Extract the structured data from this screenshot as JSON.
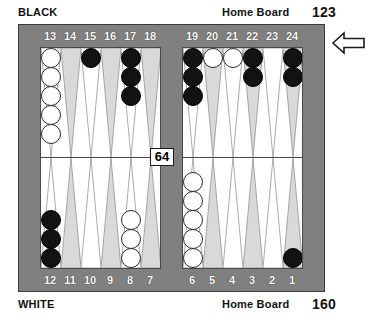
{
  "header": {
    "top_player": "BLACK",
    "top_home_label": "Home Board",
    "top_pip_count": "123"
  },
  "footer": {
    "bottom_player": "WHITE",
    "bottom_home_label": "Home Board",
    "bottom_pip_count": "160"
  },
  "bar": {
    "dice": "64"
  },
  "turn_indicator": {
    "icon": "arrow-left-icon",
    "direction": "left"
  },
  "colors": {
    "frame": "#808080",
    "field": "#ffffff",
    "point_light": "#d9d9d9",
    "point_outline": "#8a8a8a",
    "checker_white": "#ffffff",
    "checker_black": "#121212",
    "number_text": "#ffffff",
    "caption_text": "#111111"
  },
  "board": {
    "top_left_numbers": [
      "13",
      "14",
      "15",
      "16",
      "17",
      "18"
    ],
    "top_right_numbers": [
      "19",
      "20",
      "21",
      "22",
      "23",
      "24"
    ],
    "bottom_left_numbers": [
      "12",
      "11",
      "10",
      "9",
      "8",
      "7"
    ],
    "bottom_right_numbers": [
      "6",
      "5",
      "4",
      "3",
      "2",
      "1"
    ],
    "points": [
      {
        "number": "13",
        "quad": "top-left",
        "slot": 0,
        "checkers": 5,
        "color": "white"
      },
      {
        "number": "14",
        "quad": "top-left",
        "slot": 1,
        "checkers": 0,
        "color": "none"
      },
      {
        "number": "15",
        "quad": "top-left",
        "slot": 2,
        "checkers": 1,
        "color": "black"
      },
      {
        "number": "16",
        "quad": "top-left",
        "slot": 3,
        "checkers": 0,
        "color": "none"
      },
      {
        "number": "17",
        "quad": "top-left",
        "slot": 4,
        "checkers": 3,
        "color": "black"
      },
      {
        "number": "18",
        "quad": "top-left",
        "slot": 5,
        "checkers": 0,
        "color": "none"
      },
      {
        "number": "19",
        "quad": "top-right",
        "slot": 0,
        "checkers": 3,
        "color": "black"
      },
      {
        "number": "20",
        "quad": "top-right",
        "slot": 1,
        "checkers": 1,
        "color": "white"
      },
      {
        "number": "21",
        "quad": "top-right",
        "slot": 2,
        "checkers": 1,
        "color": "white"
      },
      {
        "number": "22",
        "quad": "top-right",
        "slot": 3,
        "checkers": 2,
        "color": "black"
      },
      {
        "number": "23",
        "quad": "top-right",
        "slot": 4,
        "checkers": 0,
        "color": "none"
      },
      {
        "number": "24",
        "quad": "top-right",
        "slot": 5,
        "checkers": 2,
        "color": "black"
      },
      {
        "number": "12",
        "quad": "bottom-left",
        "slot": 0,
        "checkers": 3,
        "color": "black"
      },
      {
        "number": "11",
        "quad": "bottom-left",
        "slot": 1,
        "checkers": 0,
        "color": "none"
      },
      {
        "number": "10",
        "quad": "bottom-left",
        "slot": 2,
        "checkers": 0,
        "color": "none"
      },
      {
        "number": "9",
        "quad": "bottom-left",
        "slot": 3,
        "checkers": 0,
        "color": "none"
      },
      {
        "number": "8",
        "quad": "bottom-left",
        "slot": 4,
        "checkers": 3,
        "color": "white"
      },
      {
        "number": "7",
        "quad": "bottom-left",
        "slot": 5,
        "checkers": 0,
        "color": "none"
      },
      {
        "number": "6",
        "quad": "bottom-right",
        "slot": 0,
        "checkers": 5,
        "color": "white"
      },
      {
        "number": "5",
        "quad": "bottom-right",
        "slot": 1,
        "checkers": 0,
        "color": "none"
      },
      {
        "number": "4",
        "quad": "bottom-right",
        "slot": 2,
        "checkers": 0,
        "color": "none"
      },
      {
        "number": "3",
        "quad": "bottom-right",
        "slot": 3,
        "checkers": 0,
        "color": "none"
      },
      {
        "number": "2",
        "quad": "bottom-right",
        "slot": 4,
        "checkers": 0,
        "color": "none"
      },
      {
        "number": "1",
        "quad": "bottom-right",
        "slot": 5,
        "checkers": 1,
        "color": "black"
      }
    ]
  }
}
